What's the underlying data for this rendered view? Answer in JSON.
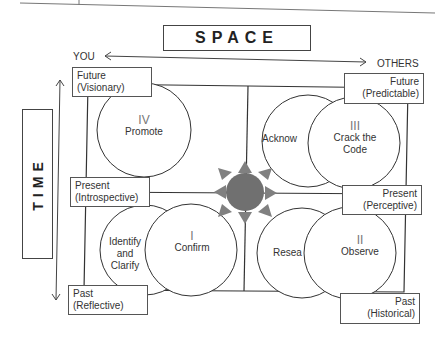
{
  "space": {
    "title": "SPACE",
    "left_label": "YOU",
    "right_label": "OTHERS"
  },
  "time": {
    "title": "TIME"
  },
  "corner_labels": {
    "top_left": {
      "line1": "Future",
      "line2": "(Visionary)"
    },
    "top_right": {
      "line1": "Future",
      "line2": "(Predictable)"
    },
    "mid_left": {
      "line1": "Present",
      "line2": "(Introspective)"
    },
    "mid_right": {
      "line1": "Present",
      "line2": "(Perceptive)"
    },
    "bottom_left": {
      "line1": "Past",
      "line2": "(Reflective)"
    },
    "bottom_right": {
      "line1": "Past",
      "line2": "(Historical)"
    }
  },
  "quadrants": {
    "q4": {
      "numeral": "IV",
      "label": "Promote"
    },
    "q3": {
      "numeral": "III",
      "label_line1": "Crack the",
      "label_line2": "Code",
      "secondary": "Acknow"
    },
    "q1": {
      "numeral": "I",
      "label": "Confirm",
      "secondary_line1": "Identify",
      "secondary_line2": "and",
      "secondary_line3": "Clarify"
    },
    "q2": {
      "numeral": "II",
      "label": "Observe",
      "secondary": "Resea"
    }
  },
  "colors": {
    "center_fill": "#707070",
    "arrow_fill": "#808080",
    "line": "#333333"
  }
}
